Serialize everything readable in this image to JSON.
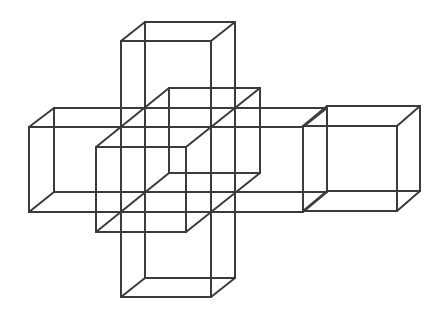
{
  "diagram": {
    "title": "",
    "stroke_color": "#3b3b3b",
    "background": "#ffffff",
    "boxes": [
      {
        "name": "vertical-column-box",
        "front": [
          121,
          41,
          211,
          297
        ],
        "back": [
          145,
          22,
          235,
          278
        ]
      },
      {
        "name": "horizontal-bar-box",
        "front": [
          29,
          127,
          303,
          212
        ],
        "back": [
          54,
          108,
          327,
          192
        ]
      },
      {
        "name": "right-end-cube",
        "front": [
          303,
          126,
          397,
          211
        ],
        "back": [
          327,
          106,
          420,
          191
        ]
      },
      {
        "name": "center-offset-cube",
        "front": [
          96,
          147,
          186,
          232
        ],
        "back": [
          169,
          88,
          260,
          173
        ]
      }
    ]
  }
}
